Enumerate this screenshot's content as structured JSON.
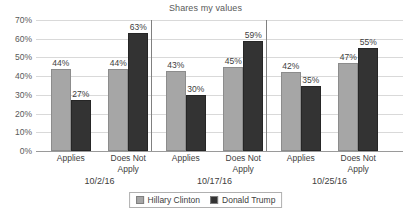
{
  "chart_data": {
    "type": "bar",
    "title": "Shares my values",
    "xlabel": "",
    "ylabel": "",
    "ylim": [
      0,
      70
    ],
    "ytick_labels": [
      "0%",
      "10%",
      "20%",
      "30%",
      "40%",
      "50%",
      "60%",
      "70%"
    ],
    "ytick_values": [
      0,
      10,
      20,
      30,
      40,
      50,
      60,
      70
    ],
    "grid": true,
    "legend_position": "bottom",
    "groups": [
      {
        "label": "10/2/16",
        "categories": [
          "Applies",
          "Does Not Apply"
        ]
      },
      {
        "label": "10/17/16",
        "categories": [
          "Applies",
          "Does Not Apply"
        ]
      },
      {
        "label": "10/25/16",
        "categories": [
          "Applies",
          "Does Not Apply"
        ]
      }
    ],
    "categories": [
      "Applies",
      "Does Not Apply",
      "Applies",
      "Does Not Apply",
      "Applies",
      "Does Not Apply"
    ],
    "series": [
      {
        "name": "Hillary Clinton",
        "color": "#a6a6a6",
        "values": [
          44,
          44,
          43,
          45,
          42,
          47
        ],
        "value_labels": [
          "44%",
          "44%",
          "43%",
          "45%",
          "42%",
          "47%"
        ]
      },
      {
        "name": "Donald Trump",
        "color": "#333333",
        "values": [
          27,
          63,
          30,
          59,
          35,
          55
        ],
        "value_labels": [
          "27%",
          "63%",
          "30%",
          "59%",
          "35%",
          "55%"
        ]
      }
    ]
  },
  "colors": {
    "clinton": "#a6a6a6",
    "trump": "#333333",
    "gridline": "#d9d9d9",
    "axis": "#9a9a9a",
    "separator": "#808080",
    "text": "#404040",
    "background": "#ffffff"
  }
}
